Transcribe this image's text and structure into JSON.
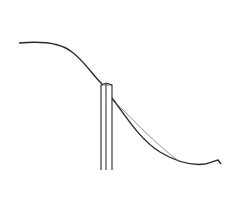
{
  "diagram": {
    "colors": {
      "background": "#ffffff",
      "stroke": "#2a2a2a",
      "thin_stroke": "#555555"
    },
    "elements": [
      {
        "name": "upper-curve",
        "type": "curve"
      },
      {
        "name": "post",
        "type": "vertical-bar"
      },
      {
        "name": "lower-thick-curve",
        "type": "curve"
      },
      {
        "name": "lower-thin-curve",
        "type": "curve"
      }
    ]
  }
}
